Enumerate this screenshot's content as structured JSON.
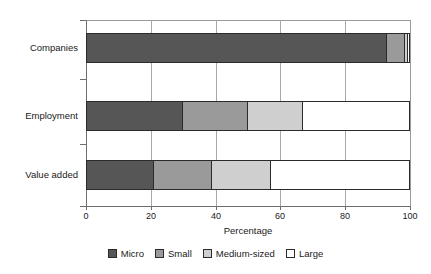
{
  "chart_data": {
    "type": "bar",
    "orientation": "horizontal",
    "stacked": true,
    "normalized": true,
    "title": "",
    "xlabel": "Percentage",
    "ylabel": "",
    "xlim": [
      0,
      100
    ],
    "xticks": [
      0,
      20,
      40,
      60,
      80,
      100
    ],
    "xticklabels": [
      "0",
      "20",
      "40",
      "60",
      "80",
      "100"
    ],
    "grid": "vertical",
    "legend_position": "bottom",
    "categories": [
      "Companies",
      "Employment",
      "Value added"
    ],
    "series": [
      {
        "name": "Micro",
        "color": "#565656",
        "values": [
          93,
          30,
          21
        ]
      },
      {
        "name": "Small",
        "color": "#9a9a9a",
        "values": [
          5.5,
          20,
          18
        ]
      },
      {
        "name": "Medium-sized",
        "color": "#cfcfcf",
        "values": [
          1,
          17,
          18
        ]
      },
      {
        "name": "Large",
        "color": "#ffffff",
        "values": [
          0.5,
          33,
          43
        ]
      }
    ]
  },
  "legend": {
    "items": [
      {
        "label": "Micro",
        "color": "#565656"
      },
      {
        "label": "Small",
        "color": "#9a9a9a"
      },
      {
        "label": "Medium-sized",
        "color": "#cfcfcf"
      },
      {
        "label": "Large",
        "color": "#ffffff"
      }
    ]
  },
  "axis": {
    "x_title": "Percentage",
    "x_tick_labels": [
      "0",
      "20",
      "40",
      "60",
      "80",
      "100"
    ],
    "y_tick_labels": [
      "Companies",
      "Employment",
      "Value added"
    ]
  }
}
